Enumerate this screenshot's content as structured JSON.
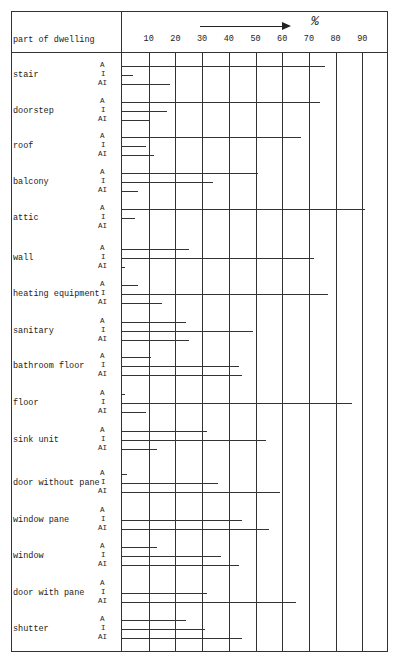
{
  "chart_data": {
    "type": "bar",
    "orientation": "horizontal",
    "title": "",
    "xlabel": "%",
    "ylabel": "part of dwelling",
    "xlim": [
      0,
      95
    ],
    "x_ticks": [
      10,
      20,
      30,
      40,
      50,
      60,
      70,
      80,
      90
    ],
    "grid": true,
    "categories": [
      "stair",
      "doorstep",
      "roof",
      "balcony",
      "attic",
      "wall",
      "heating equipment",
      "sanitary",
      "bathroom floor",
      "floor",
      "sink unit",
      "door without pane",
      "window pane",
      "window",
      "door with pane",
      "shutter"
    ],
    "series": [
      {
        "name": "A",
        "values": [
          76,
          74,
          67,
          51,
          91,
          25,
          6,
          24,
          11,
          1,
          32,
          2,
          0,
          13,
          0,
          24
        ]
      },
      {
        "name": "I",
        "values": [
          4,
          17,
          9,
          34,
          5,
          72,
          77,
          49,
          44,
          86,
          54,
          36,
          45,
          37,
          32,
          31
        ]
      },
      {
        "name": "AI",
        "values": [
          18,
          10,
          12,
          6,
          0,
          1,
          15,
          25,
          45,
          9,
          13,
          59,
          55,
          44,
          65,
          45
        ]
      }
    ]
  },
  "header": {
    "column_label": "part of dwelling",
    "unit": "%"
  }
}
